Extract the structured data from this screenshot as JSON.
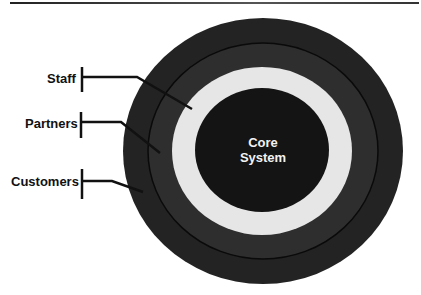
{
  "diagram": {
    "type": "concentric-rings",
    "colors": {
      "outer_ring": "#232323",
      "middle_ring": "#2e2e2e",
      "light_ring": "#e6e6e6",
      "core": "#141414",
      "ring_border": "#0a0a0a",
      "label_text": "#111111",
      "core_text": "#f2f2f2"
    },
    "core": {
      "line1": "Core",
      "line2": "System"
    },
    "labels": [
      {
        "id": "staff",
        "text": "Staff"
      },
      {
        "id": "partners",
        "text": "Partners"
      },
      {
        "id": "customers",
        "text": "Customers"
      }
    ]
  }
}
